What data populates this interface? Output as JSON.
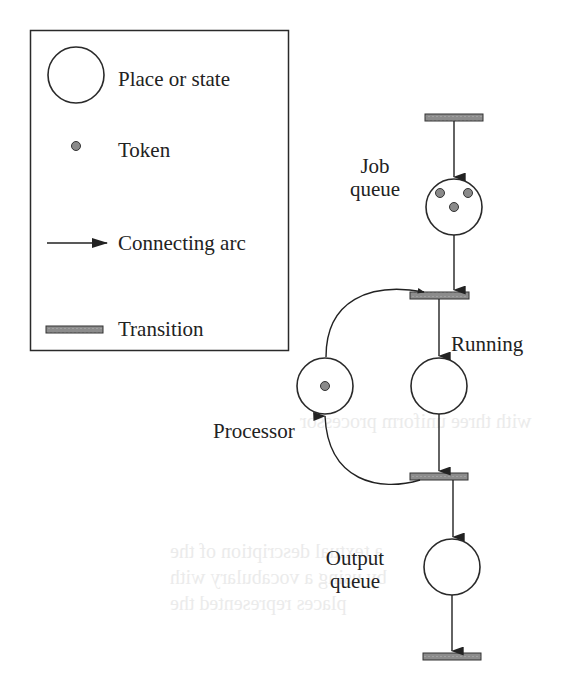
{
  "figure": {
    "colors": {
      "stroke": "#2a2a2a",
      "token_fill": "#8a8a8a",
      "transition_fill": "#8c8c8c",
      "background": "#ffffff"
    }
  },
  "legend": {
    "items": [
      {
        "icon": "place-circle-icon",
        "label": "Place or state"
      },
      {
        "icon": "token-dot-icon",
        "label": "Token"
      },
      {
        "icon": "arrow-icon",
        "label": "Connecting arc"
      },
      {
        "icon": "transition-bar-icon",
        "label": "Transition"
      }
    ]
  },
  "net": {
    "places": [
      {
        "id": "job_queue",
        "label_line1": "Job",
        "label_line2": "queue",
        "tokens": 3
      },
      {
        "id": "running",
        "label": "Running",
        "tokens": 0
      },
      {
        "id": "processor",
        "label": "Processor",
        "tokens": 1
      },
      {
        "id": "output_queue",
        "label_line1": "Output",
        "label_line2": "queue",
        "tokens": 0
      }
    ],
    "transitions": [
      {
        "id": "t_arrive"
      },
      {
        "id": "t_start"
      },
      {
        "id": "t_finish"
      },
      {
        "id": "t_depart"
      }
    ],
    "arcs": [
      {
        "from": "t_arrive",
        "to": "job_queue"
      },
      {
        "from": "job_queue",
        "to": "t_start"
      },
      {
        "from": "processor",
        "to": "t_start"
      },
      {
        "from": "t_start",
        "to": "running"
      },
      {
        "from": "running",
        "to": "t_finish"
      },
      {
        "from": "t_finish",
        "to": "processor"
      },
      {
        "from": "t_finish",
        "to": "output_queue"
      },
      {
        "from": "output_queue",
        "to": "t_depart"
      }
    ]
  }
}
